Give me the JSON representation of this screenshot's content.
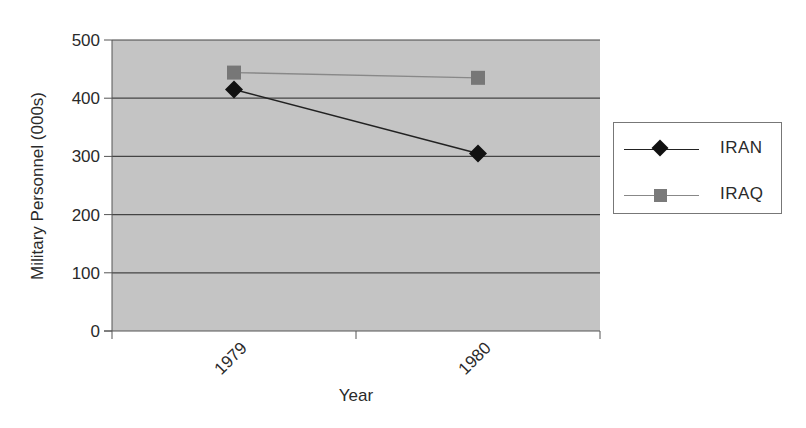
{
  "chart_data": {
    "type": "line",
    "title": "",
    "xlabel": "Year",
    "ylabel": "Military Personnel (000s)",
    "categories": [
      "1979",
      "1980"
    ],
    "series": [
      {
        "name": "IRAN",
        "values": [
          415,
          305
        ],
        "marker": "diamond",
        "color": "#111111"
      },
      {
        "name": "IRAQ",
        "values": [
          444,
          435
        ],
        "marker": "square",
        "color": "#777777"
      }
    ],
    "ylim": [
      0,
      500
    ],
    "yticks": [
      "0",
      "100",
      "200",
      "300",
      "400",
      "500"
    ],
    "grid": true,
    "legend_position": "right",
    "plot_background": "#c4c4c4"
  },
  "legend": {
    "items": [
      {
        "label": "IRAN"
      },
      {
        "label": "IRAQ"
      }
    ]
  }
}
